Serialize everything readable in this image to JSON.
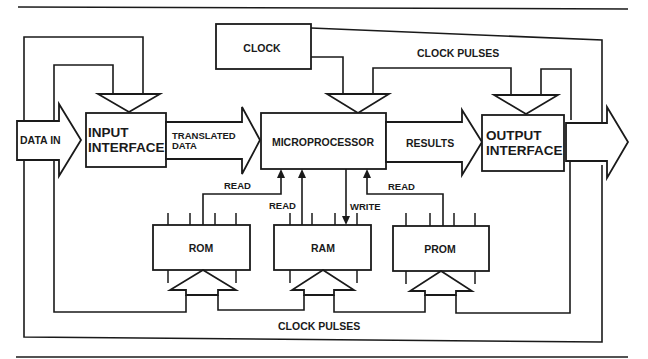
{
  "diagram": {
    "blocks": {
      "clock": "CLOCK",
      "input_interface": [
        "INPUT",
        "INTERFACE"
      ],
      "microprocessor": "MICROPROCESSOR",
      "output_interface": [
        "OUTPUT",
        "INTERFACE"
      ],
      "rom": "ROM",
      "ram": "RAM",
      "prom": "PROM"
    },
    "labels": {
      "data_in": "DATA IN",
      "translated_data": [
        "TRANSLATED",
        "DATA"
      ],
      "results": "RESULTS",
      "clock_pulses_top": "CLOCK PULSES",
      "clock_pulses_bottom": "CLOCK PULSES",
      "rom_read": "READ",
      "ram_read": "READ",
      "ram_write": "WRITE",
      "prom_read": "READ"
    },
    "colors": {
      "ink": "#1a1a1a",
      "background": "#ffffff"
    }
  }
}
